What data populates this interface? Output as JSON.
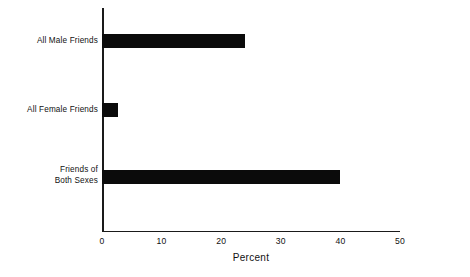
{
  "chart_data": {
    "type": "bar",
    "orientation": "horizontal",
    "title": "",
    "xlabel": "Percent",
    "ylabel": "",
    "categories": [
      "All Male Friends",
      "All Female Friends",
      "Friends of Both Sexes"
    ],
    "values": [
      24,
      2.7,
      40
    ],
    "series": [
      {
        "name": "Percent",
        "values": [
          24,
          2.7,
          40
        ]
      }
    ],
    "xlim": [
      0,
      50
    ],
    "xticks": [
      0,
      10,
      20,
      30,
      40,
      50
    ],
    "xtick_labels": [
      "0",
      "10",
      "20",
      "30",
      "40",
      "50"
    ],
    "grid": false,
    "legend": false,
    "bar_color": "#0b0b0b",
    "axis_color": "#1a1a1a",
    "background": "#ffffff"
  },
  "labels": {
    "cat0_line0": "All Male Friends",
    "cat1_line0": "All Female Friends",
    "cat2_line0": "Friends of",
    "cat2_line1": "Both Sexes",
    "xlabel": "Percent",
    "tick0": "0",
    "tick1": "10",
    "tick2": "20",
    "tick3": "30",
    "tick4": "40",
    "tick5": "50"
  }
}
